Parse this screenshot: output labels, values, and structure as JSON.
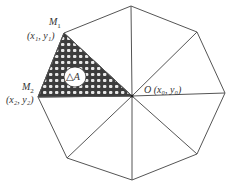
{
  "diagram": {
    "shape": "regular octagon divided into 8 triangles from interior point O",
    "colors": {
      "stroke": "#555555",
      "background": "#ffffff",
      "hatch": "#4a4a4a"
    },
    "labels": {
      "m1": "M",
      "m1_sub": "1",
      "m1_coord": "(x₁, y₁)",
      "m2": "M",
      "m2_sub": "2",
      "m2_coord": "(x₂, y₂)",
      "o": "O",
      "o_coord": "(x₀, y₀)",
      "delta_a": "△A"
    }
  }
}
